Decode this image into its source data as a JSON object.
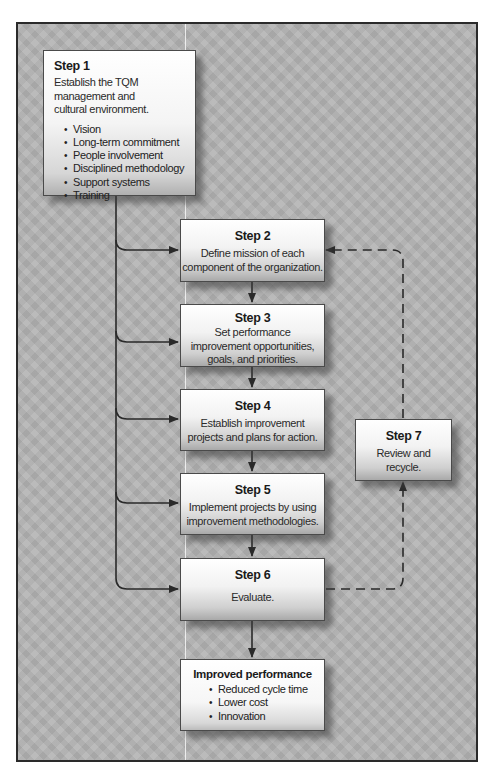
{
  "colors": {
    "background": "#b3b3b3",
    "frame_border": "#2a2a2a",
    "connector": "#2a2a2a",
    "box_top": "#ffffff",
    "box_bottom": "#a9a9a9"
  },
  "step1": {
    "title": "Step 1",
    "description": "Establish the TQM management and cultural environment.",
    "line1": "Establish the TQM",
    "line2": "management and",
    "line3": "cultural environment.",
    "items": [
      "Vision",
      "Long-term commitment",
      "People involvement",
      "Disciplined methodology",
      "Support systems",
      "Training"
    ]
  },
  "step2": {
    "title": "Step 2",
    "line1": "Define mission of each",
    "line2": "component of the organization."
  },
  "step3": {
    "title": "Step 3",
    "line1": "Set performance",
    "line2": "improvement opportunities,",
    "line3": "goals, and priorities."
  },
  "step4": {
    "title": "Step 4",
    "line1": "Establish improvement",
    "line2": "projects and plans for action."
  },
  "step5": {
    "title": "Step 5",
    "line1": "Implement projects by using",
    "line2": "improvement methodologies."
  },
  "step6": {
    "title": "Step 6",
    "line1": "Evaluate."
  },
  "step7": {
    "title": "Step 7",
    "line1": "Review and",
    "line2": "recycle."
  },
  "outcome": {
    "title": "Improved performance",
    "items": [
      "Reduced cycle time",
      "Lower cost",
      "Innovation"
    ]
  },
  "connectors": {
    "solid": [
      "step1 → step2",
      "step1 → step3",
      "step1 → step4",
      "step1 → step5",
      "step1 → step6",
      "step2 → step3",
      "step3 → step4",
      "step4 → step5",
      "step5 → step6",
      "step6 → outcome"
    ],
    "dashed": [
      "step6 → step7",
      "step7 → step2"
    ]
  }
}
